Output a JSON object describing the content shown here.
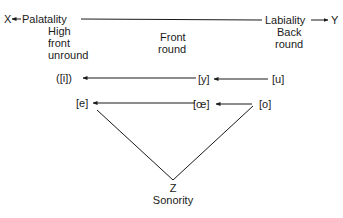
{
  "axis": {
    "left_end": "X",
    "left_label": "Palatality",
    "right_label": "Labiality",
    "right_end": "Y"
  },
  "columns": {
    "left": [
      "High",
      "front",
      "unround"
    ],
    "middle": [
      "Front",
      "round"
    ],
    "right": [
      "Back",
      "round"
    ]
  },
  "rows": {
    "top": {
      "left": "([i])",
      "middle": "[y]",
      "right": "[u]"
    },
    "bottom": {
      "left": "[e]",
      "middle": "[œ]",
      "right": "[o]"
    }
  },
  "apex": {
    "label": "Z",
    "name": "Sonority"
  },
  "colors": {
    "ink": "#1a1a1a",
    "background": "#ffffff"
  }
}
